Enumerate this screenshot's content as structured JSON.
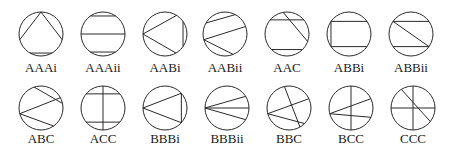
{
  "figure": {
    "stroke_color": "#2a2a2a",
    "background": "#ffffff",
    "angle_convention": "degrees, 0 = east, counter-clockwise",
    "items": [
      {
        "label": "AAAi",
        "chords": [
          [
            90,
            195
          ],
          [
            90,
            345
          ],
          [
            240,
            300
          ]
        ]
      },
      {
        "label": "AAAii",
        "chords": [
          [
            125,
            55
          ],
          [
            180,
            0
          ],
          [
            235,
            305
          ]
        ]
      },
      {
        "label": "AABi",
        "chords": [
          [
            180,
            58
          ],
          [
            180,
            300
          ],
          [
            35,
            325
          ]
        ]
      },
      {
        "label": "AABii",
        "chords": [
          [
            150,
            62
          ],
          [
            195,
            20
          ],
          [
            195,
            292
          ]
        ]
      },
      {
        "label": "AAC",
        "chords": [
          [
            140,
            40
          ],
          [
            225,
            315
          ],
          [
            100,
            340
          ]
        ]
      },
      {
        "label": "ABBi",
        "chords": [
          [
            145,
            215
          ],
          [
            145,
            35
          ],
          [
            215,
            325
          ]
        ]
      },
      {
        "label": "ABBii",
        "chords": [
          [
            145,
            35
          ],
          [
            215,
            325
          ],
          [
            145,
            325
          ]
        ]
      },
      {
        "label": "ABC",
        "chords": [
          [
            195,
            28
          ],
          [
            195,
            305
          ],
          [
            108,
            12
          ]
        ]
      },
      {
        "label": "ACC",
        "chords": [
          [
            90,
            270
          ],
          [
            140,
            40
          ],
          [
            220,
            320
          ]
        ]
      },
      {
        "label": "BBBi",
        "chords": [
          [
            180,
            42
          ],
          [
            180,
            318
          ],
          [
            42,
            318
          ]
        ]
      },
      {
        "label": "BBBii",
        "chords": [
          [
            180,
            32
          ],
          [
            180,
            0
          ],
          [
            180,
            328
          ]
        ]
      },
      {
        "label": "BBC",
        "chords": [
          [
            195,
            25
          ],
          [
            195,
            315
          ],
          [
            102,
            300
          ]
        ]
      },
      {
        "label": "BCC",
        "chords": [
          [
            90,
            270
          ],
          [
            195,
            25
          ],
          [
            195,
            335
          ]
        ]
      },
      {
        "label": "CCC",
        "chords": [
          [
            90,
            270
          ],
          [
            180,
            0
          ],
          [
            122,
            322
          ]
        ]
      }
    ]
  }
}
